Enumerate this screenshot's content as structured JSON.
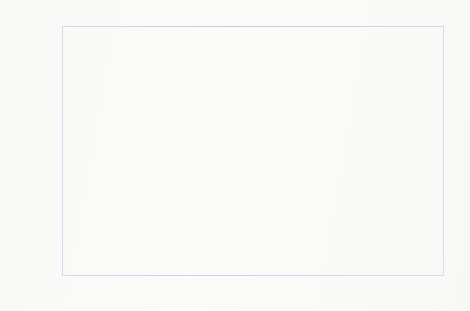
{
  "chart_data": {
    "type": "bar",
    "subtype": "stacked-column",
    "title": "",
    "xlabel": "",
    "ylabel": "Total stocks of petroleum (Thousand tonnes)",
    "ylim": [
      0,
      20000
    ],
    "ytick_labels": [
      "20,000",
      "18,000",
      "16,000",
      "14,000",
      "12,000",
      "10,000",
      "8,000",
      "6,000",
      "4,000",
      "2,000",
      "-"
    ],
    "ytick_values": [
      20000,
      18000,
      16000,
      14000,
      12000,
      10000,
      8000,
      6000,
      4000,
      2000,
      0
    ],
    "grid": false,
    "legend_position": "top-center-inside",
    "categories": [
      "1995",
      "1996",
      "1997",
      "1998",
      "1999",
      "2000",
      "2001",
      "2002",
      "2003",
      "2004",
      "2005",
      "2006",
      "2007",
      "2008",
      "2009",
      "2010",
      "2011",
      "2012",
      "2013",
      "2014",
      "2015",
      "2016",
      "2017",
      "2018"
    ],
    "series": [
      {
        "name": "Net bilaterals of all products",
        "color": "#7ea4da",
        "values": [
          1700,
          1550,
          2050,
          2350,
          1400,
          300,
          750,
          1300,
          1900,
          1600,
          1700,
          1650,
          1400,
          2550,
          3150,
          2850,
          2300,
          2700,
          3950,
          3800,
          4350,
          4200,
          4250,
          4500
        ]
      },
      {
        "name": "Stocks in UK",
        "color": "#ec9a50",
        "values": [
          14500,
          14900,
          14450,
          15250,
          14900,
          14150,
          15300,
          13900,
          13750,
          13000,
          12200,
          13150,
          12550,
          12650,
          12050,
          11250,
          10600,
          10800,
          10300,
          10300,
          10750,
          10700,
          10650,
          10000
        ]
      }
    ],
    "totals": [
      16200,
      16450,
      16500,
      17600,
      16300,
      14450,
      16050,
      15200,
      15650,
      14600,
      13900,
      14800,
      13950,
      15200,
      15200,
      14100,
      12900,
      13500,
      14250,
      14100,
      15100,
      14900,
      14900,
      14500
    ]
  },
  "legend": {
    "entries": [
      {
        "label": "Net bilaterals of all products",
        "swatch": "blue"
      },
      {
        "label": "Stocks in UK",
        "swatch": "orange"
      }
    ]
  }
}
